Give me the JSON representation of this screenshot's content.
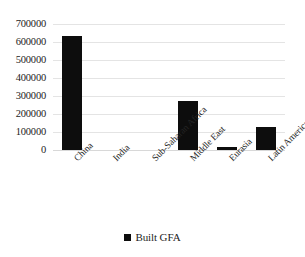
{
  "chart_data": {
    "type": "bar",
    "title": "",
    "xlabel": "",
    "ylabel": "",
    "categories": [
      "China",
      "India",
      "Sub-Saharan Africa",
      "Middle East",
      "Eurasia",
      "Latin America"
    ],
    "series": [
      {
        "name": "Built GFA",
        "color": "#0d0d0d",
        "values": [
          633000,
          0,
          0,
          272000,
          17000,
          128000
        ]
      }
    ],
    "ylim": [
      0,
      700000
    ],
    "ytick_values": [
      700000,
      600000,
      500000,
      400000,
      300000,
      200000,
      100000,
      0
    ],
    "ytick_labels": [
      "700000",
      "600000",
      "500000",
      "400000",
      "300000",
      "200000",
      "100000",
      "0"
    ],
    "grid": true,
    "grid_color": "#e4e4e4",
    "legend": {
      "position": "bottom",
      "entries": [
        {
          "label": "Built GFA",
          "color": "#0d0d0d",
          "marker": "square"
        }
      ]
    },
    "x_label_rotation": -45,
    "background": "#ffffff"
  }
}
